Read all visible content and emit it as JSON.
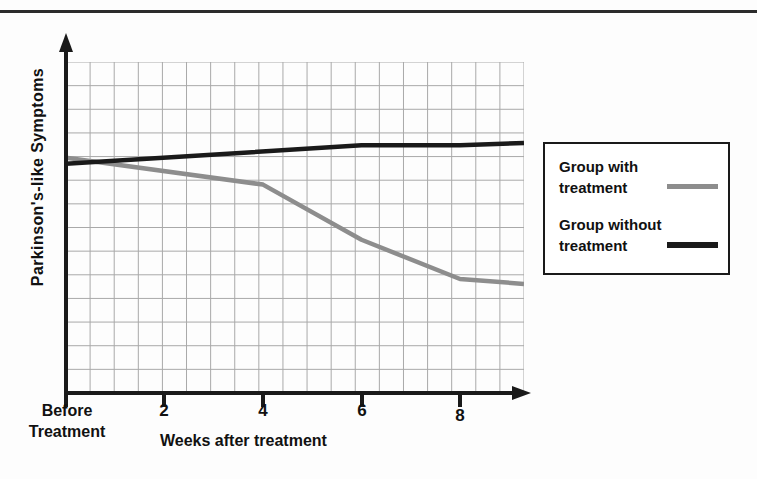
{
  "page": {
    "background": "#fdfdfd",
    "rule_color": "#2b2b2b"
  },
  "chart_data": {
    "type": "line",
    "title": "",
    "xlabel": "Weeks after treatment",
    "ylabel": "Parkinson's-like Symptoms",
    "x_tick_labels": [
      "Before Treatment",
      "2",
      "4",
      "6",
      "8"
    ],
    "x_tick_values": [
      0,
      2,
      4,
      6,
      8
    ],
    "xlim": [
      0,
      9.3
    ],
    "ylim": [
      0,
      13.5
    ],
    "y_tick_labels": [],
    "grid": true,
    "grid_color": "#a9a9a9",
    "legend_position": "right-outside",
    "series": [
      {
        "name": "Group with treatment",
        "color": "#8d8d8d",
        "x": [
          0,
          4,
          6,
          8,
          9.3
        ],
        "values": [
          9.6,
          8.5,
          6.25,
          4.65,
          4.45
        ],
        "note": "declines gradually then steeply after week 4, levelling off after week 8"
      },
      {
        "name": "Group without treatment",
        "color": "#1a1a1a",
        "x": [
          0,
          6,
          8,
          9.3
        ],
        "values": [
          9.35,
          10.1,
          10.1,
          10.2
        ],
        "note": "slowly rises and stays roughly flat"
      }
    ]
  },
  "axis": {
    "x_label_before": "Before",
    "x_label_treatment": "Treatment",
    "x_tick_2": "2",
    "x_tick_4": "4",
    "x_tick_6": "6",
    "x_tick_8": "8",
    "x_title": "Weeks after treatment",
    "y_title": "Parkinson's-like Symptoms"
  },
  "legend": {
    "items": [
      {
        "label": "Group with treatment",
        "color": "#8d8d8d",
        "style": "gray"
      },
      {
        "label": "Group without treatment",
        "color": "#1a1a1a",
        "style": "black"
      }
    ]
  }
}
